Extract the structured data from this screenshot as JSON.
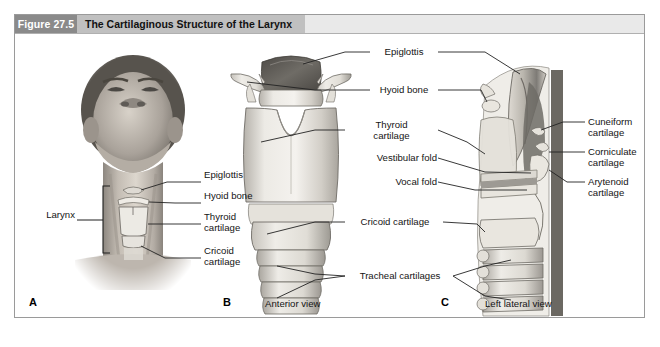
{
  "figure": {
    "number": "Figure 27.5",
    "title": "The Cartilaginous Structure of the Larynx"
  },
  "panels": [
    {
      "letter": "A",
      "view_caption": ""
    },
    {
      "letter": "B",
      "view_caption": "Anterior view"
    },
    {
      "letter": "C",
      "view_caption": "Left lateral view"
    }
  ],
  "labels": {
    "panel_a": {
      "larynx": "Larynx",
      "epiglottis": "Epiglottis",
      "hyoid_bone": "Hyoid bone",
      "thyroid_cartilage": "Thyroid\ncartilage",
      "cricoid_cartilage": "Cricoid\ncartilage"
    },
    "center": {
      "epiglottis": "Epiglottis",
      "hyoid_bone": "Hyoid bone",
      "thyroid_cartilage": "Thyroid\ncartilage",
      "vestibular_fold": "Vestibular fold",
      "vocal_fold": "Vocal fold",
      "cricoid_cartilage": "Cricoid cartilage",
      "tracheal_cartilages": "Tracheal cartilages"
    },
    "panel_c": {
      "cuneiform_cartilage": "Cuneiform\ncartilage",
      "corniculate_cartilage": "Corniculate\ncartilage",
      "arytenoid_cartilage": "Arytenoid\ncartilage"
    }
  },
  "colors": {
    "figure_number_bg": "#8a8a8a",
    "title_band_bg": "#c0c0c0",
    "header_bg": "#e9e9e9",
    "frame_border": "#9a9a9a",
    "leader_line": "#2b2b2b",
    "cartilage_light": "#e3e1dd",
    "cartilage_mid": "#c9c6c0",
    "cartilage_dark": "#8e8b85",
    "epiglottis_dark": "#6b6863",
    "skin_tone": "#b9b2aa"
  }
}
